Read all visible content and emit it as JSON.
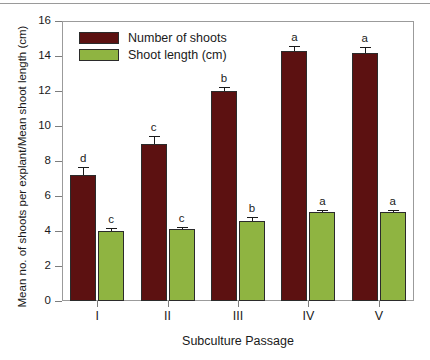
{
  "chart_data": {
    "type": "bar",
    "title": "",
    "xlabel": "Subculture Passage",
    "ylabel": "Mean no. of shoots per explant/Mean shoot length (cm)",
    "categories": [
      "I",
      "II",
      "III",
      "IV",
      "V"
    ],
    "ylim": [
      0,
      16
    ],
    "yticks": [
      0,
      2,
      4,
      6,
      8,
      10,
      12,
      14,
      16
    ],
    "ytick_labels": [
      "0",
      "2",
      "4",
      "6",
      "8",
      "10",
      "12",
      "14",
      "16"
    ],
    "grid": false,
    "legend_position": "upper left inside",
    "series": [
      {
        "name": "Number of shoots",
        "color": "#5c1111",
        "values": [
          7.2,
          9.0,
          12.0,
          14.3,
          14.2
        ],
        "errors": [
          0.45,
          0.45,
          0.25,
          0.3,
          0.3
        ],
        "annotations": [
          "d",
          "c",
          "b",
          "a",
          "a"
        ]
      },
      {
        "name": "Shoot length (cm)",
        "color": "#8fb441",
        "values": [
          4.0,
          4.1,
          4.6,
          5.1,
          5.1
        ],
        "errors": [
          0.2,
          0.15,
          0.2,
          0.1,
          0.1
        ],
        "annotations": [
          "c",
          "c",
          "b",
          "a",
          "a"
        ]
      }
    ]
  },
  "legend": {
    "items": [
      {
        "label": "Number of shoots",
        "color": "#5c1111"
      },
      {
        "label": "Shoot length (cm)",
        "color": "#8fb441"
      }
    ]
  },
  "axes": {
    "x_title": "Subculture Passage",
    "y_title": "Mean no. of shoots per explant/Mean shoot length (cm)"
  }
}
